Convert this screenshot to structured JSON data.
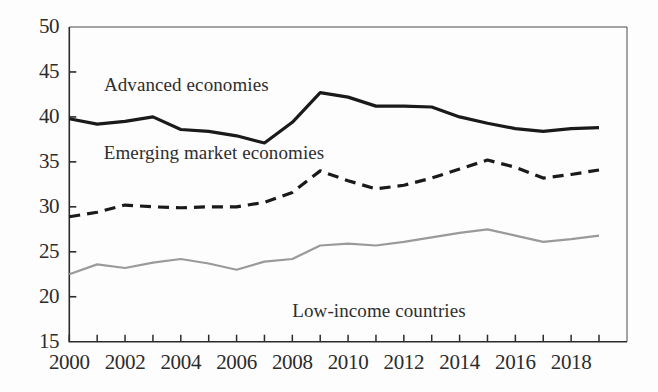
{
  "chart_data": {
    "type": "line",
    "title": "",
    "subtitle": "",
    "xlabel": "",
    "ylabel": "",
    "xlim": [
      2000,
      2019
    ],
    "ylim": [
      15,
      50
    ],
    "grid": false,
    "legend_position": "inline-annotations",
    "x": [
      2000,
      2001,
      2002,
      2003,
      2004,
      2005,
      2006,
      2007,
      2008,
      2009,
      2010,
      2011,
      2012,
      2013,
      2014,
      2015,
      2016,
      2017,
      2018,
      2019
    ],
    "y_ticks": [
      15,
      20,
      25,
      30,
      35,
      40,
      45,
      50
    ],
    "x_ticks": [
      2000,
      2001,
      2002,
      2003,
      2004,
      2005,
      2006,
      2007,
      2008,
      2009,
      2010,
      2011,
      2012,
      2013,
      2014,
      2015,
      2016,
      2017,
      2018,
      2019
    ],
    "x_tick_labels": [
      "2000",
      "",
      "2002",
      "",
      "2004",
      "",
      "2006",
      "",
      "2008",
      "",
      "2010",
      "",
      "2012",
      "",
      "2014",
      "",
      "2016",
      "",
      "2018",
      ""
    ],
    "y_tick_labels": [
      "15",
      "20",
      "25",
      "30",
      "35",
      "40",
      "45",
      "50"
    ],
    "series": [
      {
        "name": "Advanced economies",
        "style": "solid",
        "color": "#1a1a1a",
        "width": 3.2,
        "values": [
          39.8,
          39.2,
          39.5,
          40.0,
          38.6,
          38.4,
          37.9,
          37.1,
          39.4,
          42.7,
          42.2,
          41.2,
          41.2,
          41.1,
          40.0,
          39.3,
          38.7,
          38.4,
          38.7,
          38.8
        ]
      },
      {
        "name": "Emerging market economies",
        "style": "dashed",
        "color": "#1a1a1a",
        "width": 3.2,
        "values": [
          28.9,
          29.4,
          30.2,
          30.0,
          29.9,
          30.0,
          30.0,
          30.5,
          31.6,
          34.0,
          32.9,
          32.0,
          32.4,
          33.2,
          34.2,
          35.2,
          34.4,
          33.2,
          33.6,
          34.1
        ]
      },
      {
        "name": "Low-income countries",
        "style": "solid",
        "color": "#9a9a9a",
        "width": 2.2,
        "values": [
          22.5,
          23.6,
          23.2,
          23.8,
          24.2,
          23.7,
          23.0,
          23.9,
          24.2,
          25.7,
          25.9,
          25.7,
          26.1,
          26.6,
          27.1,
          27.5,
          26.8,
          26.1,
          26.4,
          26.8
        ]
      }
    ],
    "annotations": [
      {
        "text": "Advanced economies",
        "x_value": 2004.2,
        "y_value": 43.4
      },
      {
        "text": "Emerging market economies",
        "x_value": 2005.2,
        "y_value": 35.9
      },
      {
        "text": "Low-income countries",
        "x_value": 2011.1,
        "y_value": 18.3
      }
    ]
  },
  "axis": {
    "y_labels": [
      "50",
      "45",
      "40",
      "35",
      "30",
      "25",
      "20",
      "15"
    ],
    "x_labels": [
      "2000",
      "2002",
      "2004",
      "2006",
      "2008",
      "2010",
      "2012",
      "2014",
      "2016",
      "2018"
    ]
  },
  "colors": {
    "background": "#fdfdfd",
    "axis": "#2b2b2b",
    "advanced": "#1a1a1a",
    "emerging": "#1a1a1a",
    "low_income": "#9a9a9a",
    "text": "#2b2b2b"
  }
}
